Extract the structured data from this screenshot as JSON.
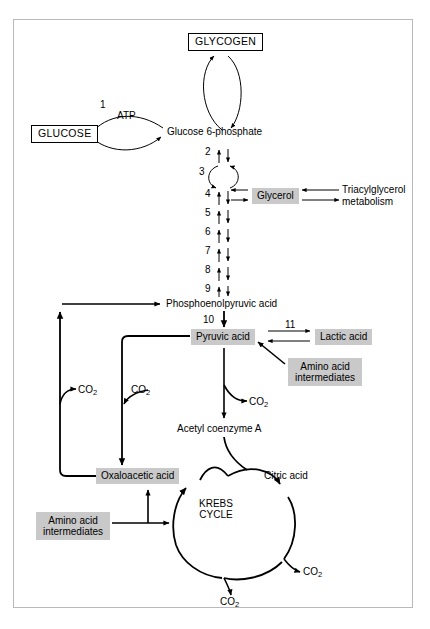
{
  "diagram": {
    "colors": {
      "shaded_box_fill": "#c9c9c9",
      "stroke": "#000000",
      "frame_border": "#b9b9b9",
      "background": "#ffffff"
    },
    "nodes": {
      "glycogen": "GLYCOGEN",
      "glucose": "GLUCOSE",
      "atp": "ATP",
      "glucose_6_phosphate": "Glucose 6-phosphate",
      "glycerol": "Glycerol",
      "triacylglycerol_metabolism_line1": "Triacylglycerol",
      "triacylglycerol_metabolism_line2": "metabolism",
      "phosphoenolpyruvic_acid": "Phosphoenolpyruvic acid",
      "pyruvic_acid": "Pyruvic acid",
      "lactic_acid": "Lactic acid",
      "amino_acid_intermediates_upper_line1": "Amino acid",
      "amino_acid_intermediates_upper_line2": "intermediates",
      "amino_acid_intermediates_lower_line1": "Amino acid",
      "amino_acid_intermediates_lower_line2": "intermediates",
      "acetyl_coenzyme_a": "Acetyl coenzyme A",
      "oxaloacetic_acid": "Oxaloacetic acid",
      "citric_acid": "Citric acid",
      "krebs_cycle_line1": "KREBS",
      "krebs_cycle_line2": "CYCLE"
    },
    "co2_labels": {
      "text": "CO",
      "subscript": "2",
      "instances": [
        "co2-left-outer",
        "co2-left-inner",
        "co2-pyruvate",
        "co2-krebs-right",
        "co2-krebs-bottom"
      ]
    },
    "step_numbers": {
      "glucose_to_g6p": "1",
      "g6p_down": "2",
      "isomerase_loop": "3",
      "step4": "4",
      "step5": "5",
      "step6": "6",
      "step7": "7",
      "step8": "8",
      "step9": "9",
      "pep_to_pyruvate": "10",
      "pyruvate_to_lactate": "11"
    }
  }
}
